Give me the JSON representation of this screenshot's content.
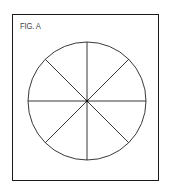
{
  "figure": {
    "label": "FIG. A",
    "shape": "circle divided into 8 equal sectors",
    "sectors": 8,
    "line_color": "#222222",
    "background": "#ffffff"
  }
}
